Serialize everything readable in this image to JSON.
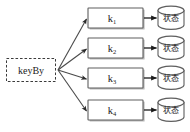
{
  "diagram": {
    "background_color": "#ffffff",
    "line_color": "#4a4a4a",
    "box_stroke_color": "#5e5e5e",
    "box_fill_color": "#ffffff",
    "text_color": "#1b1b1b",
    "source": {
      "label": "keyBy",
      "shape": "dashed-rectangle"
    },
    "branches": [
      {
        "key_base": "k",
        "key_subscript": "1",
        "key_label": "k₁",
        "state_label": "状态",
        "state_shape": "cylinder"
      },
      {
        "key_base": "k",
        "key_subscript": "2",
        "key_label": "k₂",
        "state_label": "状态",
        "state_shape": "cylinder"
      },
      {
        "key_base": "k",
        "key_subscript": "3",
        "key_label": "k₃",
        "state_label": "状态",
        "state_shape": "cylinder"
      },
      {
        "key_base": "k",
        "key_subscript": "4",
        "key_label": "k₄",
        "state_label": "状态",
        "state_shape": "cylinder"
      }
    ],
    "connectors": {
      "fan_out_name": "keyby-to-key-arrow",
      "key_to_state_name": "key-to-state-arrow",
      "arrowhead": "filled-triangle"
    }
  }
}
